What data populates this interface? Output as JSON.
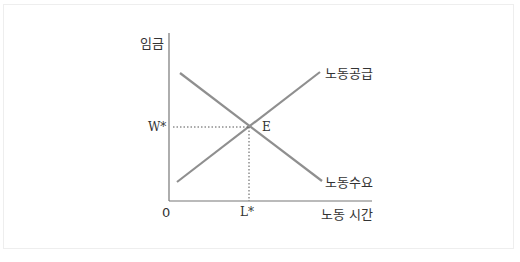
{
  "diagram": {
    "type": "labor-market-supply-demand",
    "y_axis_label": "임금",
    "x_axis_label": "노동 시간",
    "origin_label": "0",
    "equilibrium_label": "E",
    "equilibrium_wage_label": "W*",
    "equilibrium_quantity_label": "L*",
    "curves": [
      {
        "name": "노동공급",
        "slope": "upward"
      },
      {
        "name": "노동수요",
        "slope": "downward"
      }
    ],
    "colors": {
      "curve": "#8a8a8a",
      "axis": "#666666",
      "text": "#333333"
    }
  }
}
